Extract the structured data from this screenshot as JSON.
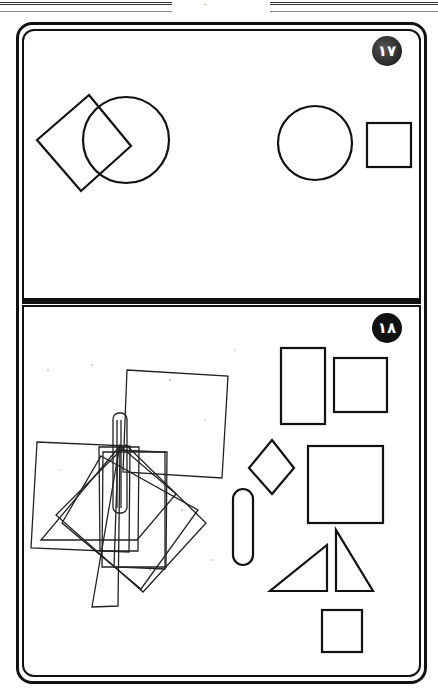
{
  "page": {
    "page_mark": "٠",
    "colors": {
      "ink": "#111111",
      "paper": "#ffffff"
    }
  },
  "exercises": [
    {
      "number": "١٧",
      "shapes": [
        "square-rotated-overlapping-circle",
        "circle",
        "square"
      ]
    },
    {
      "number": "١٨",
      "shapes": [
        "overlapping-shapes-cluster",
        "tall-rectangle",
        "square-small",
        "diamond",
        "square-large",
        "capsule",
        "right-triangle-left",
        "right-triangle-right",
        "square-bottom"
      ]
    }
  ]
}
